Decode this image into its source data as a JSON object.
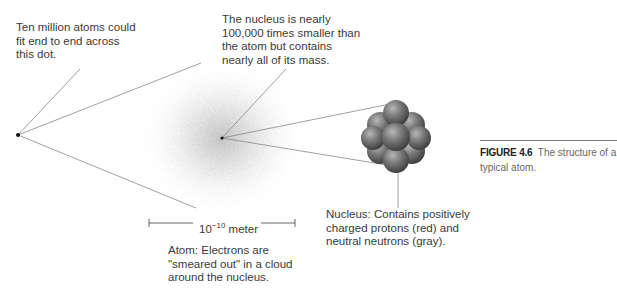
{
  "annotations": {
    "dot_note": [
      "Ten million atoms could",
      "fit end to end across",
      "this dot."
    ],
    "nucleus_note": [
      "The nucleus is nearly",
      "100,000 times smaller than",
      "the atom but contains",
      "nearly all of its mass."
    ],
    "atom_note": [
      "Atom: Electrons are",
      "\"smeared out\" in a cloud",
      "around the nucleus."
    ],
    "nucleus_label": [
      "Nucleus: Contains positively",
      "charged protons (red) and",
      "neutral neutrons (gray)."
    ]
  },
  "scale_bar": {
    "base": "10",
    "exponent": "−10",
    "unit": "meter"
  },
  "caption": {
    "figure_number": "FIGURE 4.6",
    "text": "The structure of a typical atom."
  },
  "colors": {
    "line": "#888888",
    "cloud": "#9a9a9a",
    "nucleon": "#6a6a6a",
    "rule": "#777777"
  }
}
